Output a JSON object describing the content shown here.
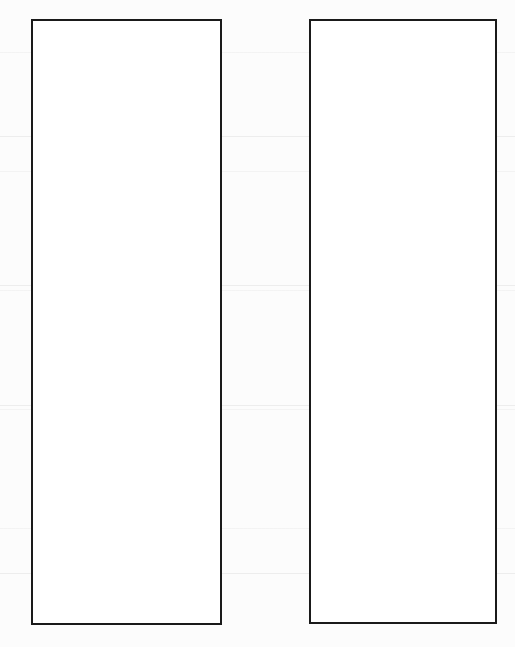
{
  "page": {
    "background": "#fcfcfc",
    "border_color": "#1a1a1a"
  },
  "boxes": [
    {
      "label": ""
    },
    {
      "label": ""
    }
  ]
}
